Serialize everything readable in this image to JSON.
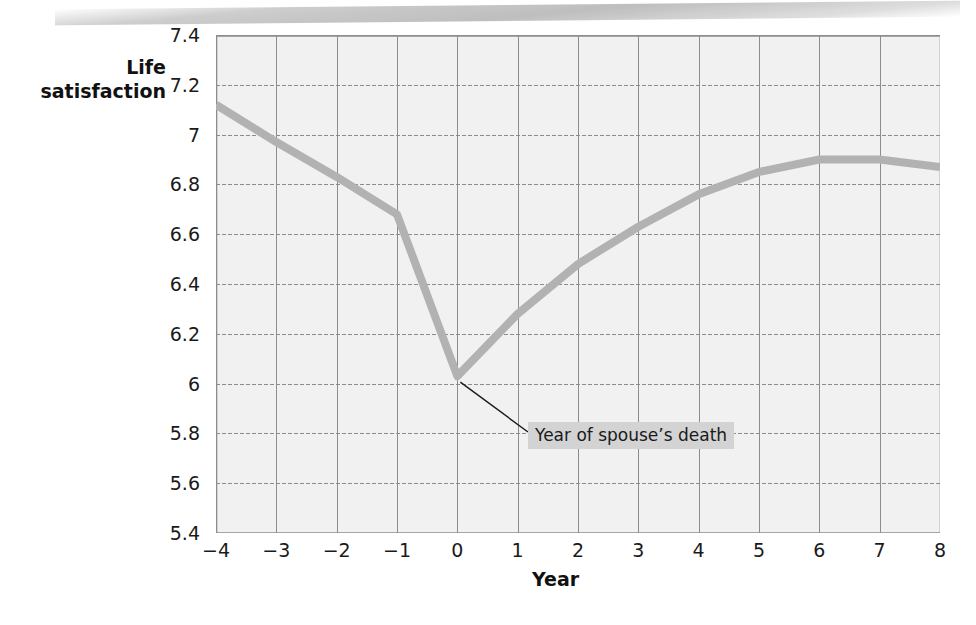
{
  "chart_data": {
    "type": "line",
    "title": "",
    "xlabel": "Year",
    "ylabel": "Life satisfaction",
    "ylabel_line1": "Life",
    "ylabel_line2": "satisfaction",
    "xlim": [
      -4,
      8
    ],
    "ylim": [
      5.4,
      7.4
    ],
    "grid": true,
    "legend": "none",
    "line_color": "#b2b2b2",
    "plot_background": "#f1f1f1",
    "grid_color": "#8c8c8c",
    "x_ticks": [
      "−4",
      "−3",
      "−2",
      "−1",
      "0",
      "1",
      "2",
      "3",
      "4",
      "5",
      "6",
      "7",
      "8"
    ],
    "y_ticks": [
      "7.4",
      "7.2",
      "7",
      "6.8",
      "6.6",
      "6.4",
      "6.2",
      "6",
      "5.8",
      "5.6",
      "5.4"
    ],
    "x": [
      -4,
      -3,
      -2,
      -1,
      0,
      1,
      2,
      3,
      4,
      5,
      6,
      7,
      8
    ],
    "values": [
      7.12,
      6.97,
      6.83,
      6.68,
      6.03,
      6.28,
      6.48,
      6.63,
      6.76,
      6.85,
      6.9,
      6.9,
      6.87
    ],
    "series": [
      {
        "name": "Life satisfaction",
        "values": [
          7.12,
          6.97,
          6.83,
          6.68,
          6.03,
          6.28,
          6.48,
          6.63,
          6.76,
          6.85,
          6.9,
          6.9,
          6.87
        ]
      }
    ],
    "annotations": [
      {
        "text": "Year of spouse’s death",
        "points_to_x": 0,
        "points_to_y": 6.03
      }
    ]
  }
}
